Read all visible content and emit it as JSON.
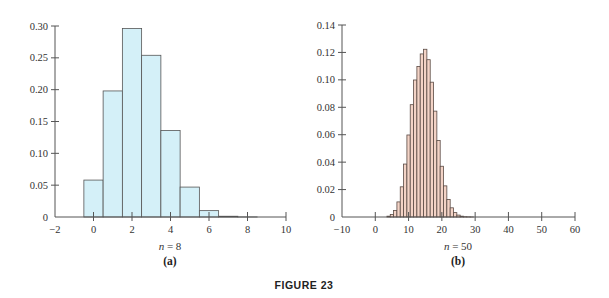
{
  "figure_label": "FIGURE 23",
  "chart_data": [
    {
      "type": "bar",
      "panel_label": "(a)",
      "xlabel": "n = 8",
      "n": 8,
      "ylabel": "",
      "title": "",
      "x": [
        0,
        1,
        2,
        3,
        4,
        5,
        6,
        7,
        8
      ],
      "values": [
        0.058,
        0.198,
        0.296,
        0.254,
        0.136,
        0.047,
        0.01,
        0.0012,
        0.0001
      ],
      "xlim": [
        -2,
        10
      ],
      "ylim": [
        0,
        0.3
      ],
      "xticks": [
        -2,
        0,
        2,
        4,
        6,
        8,
        10
      ],
      "xtick_labels": [
        "−2",
        "0",
        "2",
        "4",
        "6",
        "8",
        "10"
      ],
      "yticks": [
        0,
        0.05,
        0.1,
        0.15,
        0.2,
        0.25,
        0.3
      ],
      "ytick_labels": [
        "0",
        "0.05",
        "0.10",
        "0.15",
        "0.20",
        "0.25",
        "0.30"
      ],
      "bar_color": "#d4f0f8",
      "edge_color": "#555555",
      "grid": false,
      "legend": null
    },
    {
      "type": "bar",
      "panel_label": "(b)",
      "xlabel": "n = 50",
      "n": 50,
      "ylabel": "",
      "title": "",
      "x": [
        4,
        5,
        6,
        7,
        8,
        9,
        10,
        11,
        12,
        13,
        14,
        15,
        16,
        17,
        18,
        19,
        20,
        21,
        22,
        23,
        24,
        25,
        26,
        27,
        28,
        29
      ],
      "values": [
        0.0006,
        0.0018,
        0.0048,
        0.011,
        0.022,
        0.0386,
        0.0598,
        0.0819,
        0.0999,
        0.1098,
        0.1189,
        0.1223,
        0.1147,
        0.0983,
        0.0772,
        0.0558,
        0.037,
        0.0227,
        0.0128,
        0.0067,
        0.0032,
        0.0014,
        0.0006,
        0.0002,
        0.0001,
        3e-05
      ],
      "xlim": [
        -10,
        60
      ],
      "ylim": [
        0,
        0.14
      ],
      "xticks": [
        -10,
        0,
        10,
        20,
        30,
        40,
        50,
        60
      ],
      "xtick_labels": [
        "−10",
        "0",
        "10",
        "20",
        "30",
        "40",
        "50",
        "60"
      ],
      "yticks": [
        0,
        0.02,
        0.04,
        0.06,
        0.08,
        0.1,
        0.12,
        0.14
      ],
      "ytick_labels": [
        "0",
        "0.02",
        "0.04",
        "0.06",
        "0.08",
        "0.10",
        "0.12",
        "0.14"
      ],
      "bar_color": "#f3d3c6",
      "edge_color": "#5a4a44",
      "grid": false,
      "legend": null
    }
  ]
}
